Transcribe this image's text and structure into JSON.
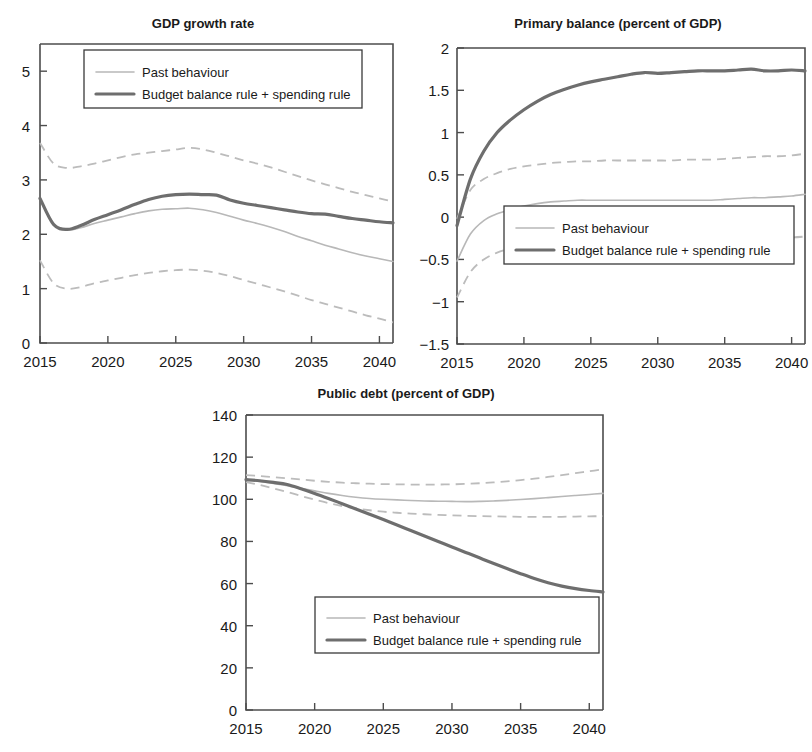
{
  "figure": {
    "background": "#ffffff",
    "colors": {
      "past_behaviour": "#b8b8b8",
      "past_behaviour_band": "#bcbcbc",
      "rule_scenario": "#6e6e6e",
      "axis": "#4d4d4d",
      "text": "#1a1a1a"
    },
    "legend_labels": {
      "past": "Past behaviour",
      "rule": "Budget balance rule + spending rule"
    }
  },
  "chart_data": [
    {
      "id": "gdp-growth",
      "type": "line",
      "title": "GDP growth rate",
      "xlabel": "",
      "ylabel": "",
      "xlim": [
        2015,
        2041
      ],
      "ylim": [
        0,
        5.5
      ],
      "xticks": [
        2015,
        2020,
        2025,
        2030,
        2035,
        2040
      ],
      "yticks": [
        0,
        1,
        2,
        3,
        4,
        5
      ],
      "xtick_labels": [
        "2015",
        "2020",
        "2025",
        "2030",
        "2035",
        "2040"
      ],
      "ytick_labels": [
        "0",
        "1",
        "2",
        "3",
        "4",
        "5"
      ],
      "grid": false,
      "legend_position": "top-left",
      "x": [
        2015,
        2016,
        2017,
        2018,
        2019,
        2020,
        2021,
        2022,
        2023,
        2024,
        2025,
        2026,
        2027,
        2028,
        2029,
        2030,
        2031,
        2032,
        2033,
        2034,
        2035,
        2036,
        2037,
        2038,
        2039,
        2040,
        2041
      ],
      "series": [
        {
          "name": "Past behaviour",
          "style": "solid-light",
          "values": [
            2.65,
            2.2,
            2.08,
            2.12,
            2.2,
            2.26,
            2.32,
            2.38,
            2.43,
            2.46,
            2.47,
            2.48,
            2.45,
            2.4,
            2.33,
            2.26,
            2.2,
            2.13,
            2.05,
            1.96,
            1.88,
            1.8,
            1.73,
            1.66,
            1.6,
            1.55,
            1.5
          ]
        },
        {
          "name": "Past behaviour upper band",
          "style": "dashed-light",
          "values": [
            3.68,
            3.3,
            3.22,
            3.25,
            3.3,
            3.36,
            3.42,
            3.47,
            3.5,
            3.53,
            3.56,
            3.59,
            3.56,
            3.5,
            3.43,
            3.36,
            3.3,
            3.23,
            3.15,
            3.07,
            2.99,
            2.92,
            2.85,
            2.78,
            2.72,
            2.66,
            2.6
          ]
        },
        {
          "name": "Past behaviour lower band",
          "style": "dashed-light",
          "values": [
            1.52,
            1.1,
            1.0,
            1.03,
            1.1,
            1.15,
            1.2,
            1.25,
            1.29,
            1.32,
            1.34,
            1.35,
            1.33,
            1.29,
            1.23,
            1.16,
            1.09,
            1.02,
            0.95,
            0.87,
            0.79,
            0.72,
            0.65,
            0.58,
            0.51,
            0.45,
            0.38
          ]
        },
        {
          "name": "Budget balance rule + spending rule",
          "style": "solid-dark",
          "values": [
            2.66,
            2.18,
            2.09,
            2.16,
            2.27,
            2.36,
            2.45,
            2.55,
            2.64,
            2.7,
            2.73,
            2.74,
            2.73,
            2.72,
            2.63,
            2.57,
            2.53,
            2.49,
            2.45,
            2.41,
            2.38,
            2.37,
            2.33,
            2.29,
            2.26,
            2.23,
            2.21
          ]
        }
      ]
    },
    {
      "id": "primary-balance",
      "type": "line",
      "title": "Primary balance (percent of GDP)",
      "xlabel": "",
      "ylabel": "",
      "xlim": [
        2015,
        2041
      ],
      "ylim": [
        -1.5,
        2
      ],
      "xticks": [
        2015,
        2020,
        2025,
        2030,
        2035,
        2040
      ],
      "yticks": [
        -1.5,
        -1,
        -0.5,
        0,
        0.5,
        1,
        1.5,
        2
      ],
      "xtick_labels": [
        "2015",
        "2020",
        "2025",
        "2030",
        "2035",
        "2040"
      ],
      "ytick_labels": [
        "−1.5",
        "−1",
        "−0.5",
        "0",
        "0.5",
        "1",
        "1.5",
        "2"
      ],
      "grid": false,
      "legend_position": "bottom-center",
      "x": [
        2015,
        2016,
        2017,
        2018,
        2019,
        2020,
        2021,
        2022,
        2023,
        2024,
        2025,
        2026,
        2027,
        2028,
        2029,
        2030,
        2031,
        2032,
        2033,
        2034,
        2035,
        2036,
        2037,
        2038,
        2039,
        2040,
        2041
      ],
      "series": [
        {
          "name": "Past behaviour",
          "style": "solid-light",
          "values": [
            -0.52,
            -0.2,
            -0.04,
            0.04,
            0.09,
            0.13,
            0.16,
            0.18,
            0.19,
            0.2,
            0.2,
            0.2,
            0.2,
            0.2,
            0.2,
            0.2,
            0.2,
            0.2,
            0.2,
            0.2,
            0.21,
            0.22,
            0.23,
            0.23,
            0.24,
            0.25,
            0.27
          ]
        },
        {
          "name": "Past behaviour upper band",
          "style": "dashed-light",
          "values": [
            -0.02,
            0.32,
            0.45,
            0.52,
            0.57,
            0.6,
            0.62,
            0.64,
            0.65,
            0.66,
            0.66,
            0.67,
            0.67,
            0.67,
            0.67,
            0.67,
            0.67,
            0.68,
            0.68,
            0.68,
            0.69,
            0.7,
            0.71,
            0.72,
            0.72,
            0.73,
            0.75
          ]
        },
        {
          "name": "Past behaviour lower band",
          "style": "dashed-light",
          "values": [
            -0.95,
            -0.65,
            -0.5,
            -0.42,
            -0.37,
            -0.34,
            -0.32,
            -0.3,
            -0.29,
            -0.28,
            -0.28,
            -0.28,
            -0.28,
            -0.28,
            -0.28,
            -0.28,
            -0.28,
            -0.28,
            -0.28,
            -0.28,
            -0.27,
            -0.26,
            -0.25,
            -0.25,
            -0.24,
            -0.24,
            -0.23
          ]
        },
        {
          "name": "Budget balance rule + spending rule",
          "style": "solid-dark",
          "values": [
            -0.1,
            0.45,
            0.78,
            1.0,
            1.15,
            1.27,
            1.37,
            1.45,
            1.51,
            1.56,
            1.6,
            1.63,
            1.66,
            1.69,
            1.71,
            1.7,
            1.71,
            1.72,
            1.73,
            1.73,
            1.73,
            1.74,
            1.75,
            1.73,
            1.73,
            1.74,
            1.73
          ]
        }
      ]
    },
    {
      "id": "public-debt",
      "type": "line",
      "title": "Public debt (percent of GDP)",
      "xlabel": "",
      "ylabel": "",
      "xlim": [
        2015,
        2041
      ],
      "ylim": [
        0,
        140
      ],
      "xticks": [
        2015,
        2020,
        2025,
        2030,
        2035,
        2040
      ],
      "yticks": [
        0,
        20,
        40,
        60,
        80,
        100,
        120,
        140
      ],
      "xtick_labels": [
        "2015",
        "2020",
        "2025",
        "2030",
        "2035",
        "2040"
      ],
      "ytick_labels": [
        "0",
        "20",
        "40",
        "60",
        "80",
        "100",
        "120",
        "140"
      ],
      "grid": false,
      "legend_position": "bottom-center",
      "x": [
        2015,
        2016,
        2017,
        2018,
        2019,
        2020,
        2021,
        2022,
        2023,
        2024,
        2025,
        2026,
        2027,
        2028,
        2029,
        2030,
        2031,
        2032,
        2033,
        2034,
        2035,
        2036,
        2037,
        2038,
        2039,
        2040,
        2041
      ],
      "series": [
        {
          "name": "Past behaviour",
          "style": "solid-light",
          "values": [
            109.5,
            108.5,
            107.5,
            106.5,
            105.2,
            104.0,
            102.8,
            101.8,
            101.0,
            100.4,
            100.0,
            99.7,
            99.4,
            99.2,
            99.1,
            99.0,
            98.9,
            99.0,
            99.2,
            99.5,
            99.9,
            100.3,
            100.8,
            101.3,
            101.8,
            102.3,
            102.8
          ]
        },
        {
          "name": "Past behaviour upper band",
          "style": "dashed-light",
          "values": [
            111.5,
            111.0,
            110.5,
            110.0,
            109.4,
            108.8,
            108.3,
            107.9,
            107.6,
            107.4,
            107.2,
            107.1,
            107.0,
            107.0,
            107.0,
            107.1,
            107.3,
            107.6,
            108.0,
            108.5,
            109.1,
            109.8,
            110.6,
            111.5,
            112.4,
            113.3,
            114.2
          ]
        },
        {
          "name": "Past behaviour lower band",
          "style": "dashed-light",
          "values": [
            108.2,
            106.8,
            105.2,
            103.5,
            101.6,
            99.8,
            98.2,
            96.8,
            95.7,
            94.8,
            94.1,
            93.6,
            93.2,
            92.9,
            92.6,
            92.4,
            92.2,
            92.0,
            91.9,
            91.8,
            91.7,
            91.7,
            91.7,
            91.7,
            91.8,
            91.9,
            92.0
          ]
        },
        {
          "name": "Budget balance rule + spending rule",
          "style": "solid-dark",
          "values": [
            109.3,
            108.8,
            108.0,
            107.0,
            105.0,
            102.8,
            100.4,
            97.9,
            95.4,
            92.9,
            90.4,
            87.8,
            85.2,
            82.6,
            80.0,
            77.4,
            74.8,
            72.2,
            69.6,
            67.1,
            64.7,
            62.4,
            60.4,
            58.8,
            57.6,
            56.7,
            56.0
          ]
        }
      ]
    }
  ]
}
